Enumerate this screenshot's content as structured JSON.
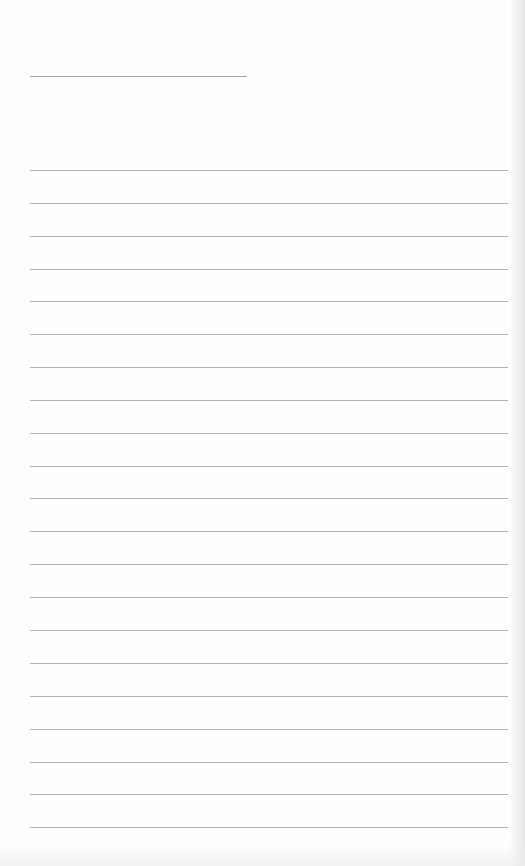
{
  "page": {
    "type": "blank-lined-paper",
    "background_color": "#fefefe",
    "line_color": "#b3b3b3"
  },
  "header_line": {
    "x": 30,
    "y": 76,
    "width": 217
  },
  "ruled_lines": {
    "count": 21,
    "x": 30,
    "width": 478,
    "first_y": 170,
    "spacing": 32.85,
    "positions_y": [
      170,
      203,
      236,
      269,
      301,
      334,
      367,
      400,
      433,
      466,
      498,
      531,
      564,
      597,
      630,
      663,
      696,
      729,
      762,
      794,
      827
    ]
  }
}
